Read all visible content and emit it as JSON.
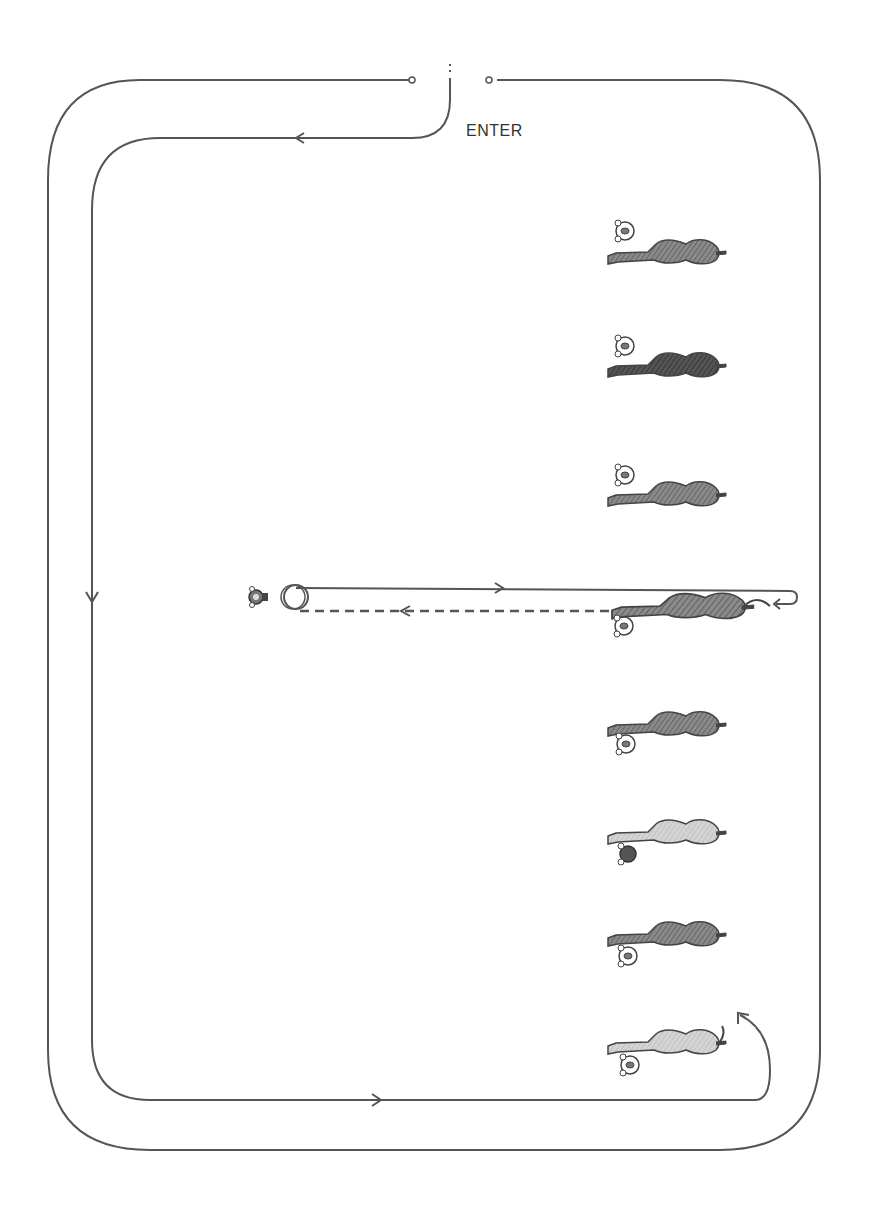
{
  "diagram": {
    "type": "horse-show-pattern",
    "enter_label": "ENTER",
    "colors": {
      "line": "#555555",
      "horse_dark": "#4a4a4a",
      "horse_mid": "#7a7a7a",
      "horse_light": "#c8c8c8",
      "background": "#ffffff"
    },
    "lineup_horses": [
      {
        "index": 1,
        "shade": "mid",
        "handler_side": "top"
      },
      {
        "index": 2,
        "shade": "dark",
        "handler_side": "top"
      },
      {
        "index": 3,
        "shade": "mid",
        "handler_side": "top"
      },
      {
        "index": 4,
        "shade": "mid",
        "handler_side": "bottom",
        "working": true
      },
      {
        "index": 5,
        "shade": "mid",
        "handler_side": "bottom"
      },
      {
        "index": 6,
        "shade": "light",
        "handler_side": "bottom"
      },
      {
        "index": 7,
        "shade": "mid",
        "handler_side": "bottom"
      },
      {
        "index": 8,
        "shade": "light",
        "handler_side": "bottom"
      }
    ],
    "judge": {
      "icon": "judge-icon"
    },
    "paths": {
      "outer_rail": "arena-outer-rail",
      "inner_rail": "arena-inner-rail",
      "out_line": "solid-line-to-judge",
      "return_line": "dashed-line-return"
    }
  }
}
